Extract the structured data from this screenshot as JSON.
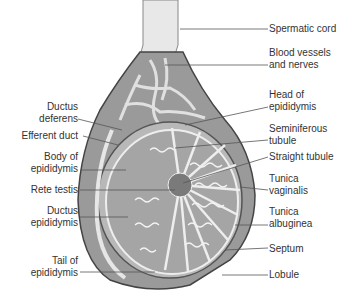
{
  "diagram": {
    "labels_left": [
      {
        "id": "ductus-deferens",
        "line1": "Ductus",
        "line2": "deferens"
      },
      {
        "id": "efferent-duct",
        "line1": "Efferent duct",
        "line2": ""
      },
      {
        "id": "body-of-epididymis",
        "line1": "Body of",
        "line2": "epididymis"
      },
      {
        "id": "rete-testis",
        "line1": "Rete testis",
        "line2": ""
      },
      {
        "id": "ductus-epididymis",
        "line1": "Ductus",
        "line2": "epididymis"
      },
      {
        "id": "tail-of-epididymis",
        "line1": "Tail of",
        "line2": "epididymis"
      }
    ],
    "labels_right": [
      {
        "id": "spermatic-cord",
        "line1": "Spermatic cord",
        "line2": ""
      },
      {
        "id": "blood-vessels-and-nerves",
        "line1": "Blood vessels",
        "line2": "and nerves"
      },
      {
        "id": "head-of-epididymis",
        "line1": "Head of",
        "line2": "epididymis"
      },
      {
        "id": "seminiferous-tubule",
        "line1": "Seminiferous",
        "line2": "tubule"
      },
      {
        "id": "straight-tubule",
        "line1": "Straight tubule",
        "line2": ""
      },
      {
        "id": "tunica-vaginalis",
        "line1": "Tunica",
        "line2": "vaginalis"
      },
      {
        "id": "tunica-albuginea",
        "line1": "Tunica",
        "line2": "albuginea"
      },
      {
        "id": "septum",
        "line1": "Septum",
        "line2": ""
      },
      {
        "id": "lobule",
        "line1": "Lobule",
        "line2": ""
      }
    ],
    "colors": {
      "outline": "#4a4a4a",
      "fill_dark": "#8c8c8c",
      "fill_mid": "#b0b0b0",
      "fill_light": "#dcdcdc",
      "text": "#333333"
    }
  }
}
